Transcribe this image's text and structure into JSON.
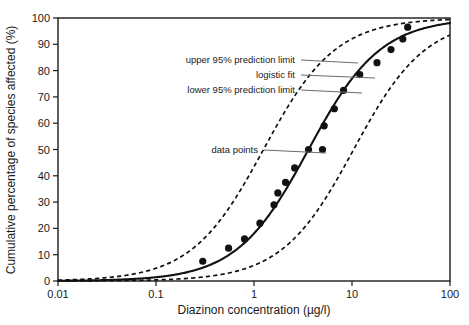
{
  "chart_data": {
    "type": "scatter",
    "title": "",
    "xlabel": "Diazinon concentration (µg/l)",
    "ylabel": "Cumulative percentage of species affected (%)",
    "xscale": "log",
    "xlim": [
      0.01,
      100
    ],
    "ylim": [
      0,
      100
    ],
    "grid": false,
    "x_ticks": [
      0.01,
      0.1,
      1,
      10,
      100
    ],
    "x_tick_labels": [
      "0.01",
      "0.1",
      "1",
      "10",
      "100"
    ],
    "y_ticks": [
      0,
      10,
      20,
      30,
      40,
      50,
      60,
      70,
      80,
      90,
      100
    ],
    "y_tick_labels": [
      "0",
      "10",
      "20",
      "30",
      "40",
      "50",
      "60",
      "70",
      "80",
      "90",
      "100"
    ],
    "series": [
      {
        "name": "data points",
        "type": "scatter",
        "marker": "filled-circle",
        "color": "#111111",
        "points": [
          {
            "x": 0.3,
            "y": 7.5
          },
          {
            "x": 0.55,
            "y": 12.5
          },
          {
            "x": 0.8,
            "y": 16.0
          },
          {
            "x": 1.15,
            "y": 22.0
          },
          {
            "x": 1.6,
            "y": 29.0
          },
          {
            "x": 1.75,
            "y": 33.5
          },
          {
            "x": 2.1,
            "y": 37.5
          },
          {
            "x": 2.6,
            "y": 43.0
          },
          {
            "x": 3.6,
            "y": 50.0
          },
          {
            "x": 5.0,
            "y": 50.0
          },
          {
            "x": 5.2,
            "y": 59.0
          },
          {
            "x": 6.6,
            "y": 65.5
          },
          {
            "x": 8.2,
            "y": 72.5
          },
          {
            "x": 12.0,
            "y": 78.5
          },
          {
            "x": 18.0,
            "y": 83.0
          },
          {
            "x": 25.0,
            "y": 88.0
          },
          {
            "x": 33.0,
            "y": 92.0
          },
          {
            "x": 37.0,
            "y": 96.5
          }
        ]
      },
      {
        "name": "logistic fit",
        "type": "line",
        "style": "solid",
        "color": "#111111",
        "logistic": {
          "ec50": 3.6,
          "slope": 1.18,
          "max": 100
        }
      },
      {
        "name": "upper 95% prediction limit",
        "type": "line",
        "style": "dashed",
        "color": "#111111",
        "logistic": {
          "ec50": 1.25,
          "slope": 1.18,
          "max": 100
        }
      },
      {
        "name": "lower 95% prediction limit",
        "type": "line",
        "style": "dashed",
        "color": "#111111",
        "logistic": {
          "ec50": 10.4,
          "slope": 1.18,
          "max": 100
        }
      }
    ],
    "annotations": [
      {
        "label": "upper 95% prediction limit",
        "text_x": 295,
        "text_y": 63,
        "leader_to_x": 358,
        "leader_to_y": 63
      },
      {
        "label": "logistic fit",
        "text_x": 295,
        "text_y": 78,
        "leader_to_x": 375,
        "leader_to_y": 78
      },
      {
        "label": "lower 95% prediction limit",
        "text_x": 295,
        "text_y": 93,
        "leader_to_x": 362,
        "leader_to_y": 93
      },
      {
        "label": "data points",
        "text_x": 258,
        "text_y": 153,
        "leader_to_x": 326,
        "leader_to_y": 153
      }
    ]
  },
  "axes": {
    "x_title": "Diazinon concentration (µg/l)",
    "y_title": "Cumulative percentage of species affected (%)",
    "x_tick_labels": [
      "0.01",
      "0.1",
      "1",
      "10",
      "100"
    ],
    "y_tick_labels": [
      "0",
      "10",
      "20",
      "30",
      "40",
      "50",
      "60",
      "70",
      "80",
      "90",
      "100"
    ]
  },
  "annotation_labels": {
    "upper_limit": "upper 95% prediction limit",
    "logistic_fit": "logistic fit",
    "lower_limit": "lower 95% prediction limit",
    "data_points": "data points"
  },
  "colors": {
    "curve": "#111111",
    "marker": "#111111",
    "leader": "#6b6b6b",
    "frame": "#1a1a1a",
    "text": "#1a1a1a",
    "background": "#ffffff"
  }
}
